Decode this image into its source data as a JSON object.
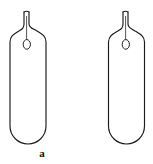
{
  "figure": {
    "title": "",
    "background_color": "#ffffff",
    "stroke_color": "#1a1a1a",
    "fill_color": "#ffffff",
    "width": 153,
    "height": 164,
    "panels": [
      {
        "id": "a",
        "caption": "a",
        "object": "sealed-capillary-tube",
        "description": "Sealed glass ampoule with rounded bottom, tapered shoulders and narrow capillary neck containing a small oval bubble",
        "geometry": {
          "body_left": 10,
          "body_right": 46,
          "body_bottom": 144,
          "bottom_radius": 18,
          "shoulder_top": 30,
          "neck_left": 24,
          "neck_right": 29,
          "neck_top": 12,
          "bubble_cx": 27,
          "bubble_cy": 44,
          "bubble_rx": 3.6,
          "bubble_ry": 4.8,
          "center_line_top": 16,
          "center_line_bottom": 40
        }
      },
      {
        "id": "b",
        "caption": "b",
        "object": "sealed-capillary-tube",
        "description": "Sealed glass ampoule with rounded bottom, tapered shoulders and narrow capillary neck containing a small oval bubble",
        "geometry": {
          "body_left": 32,
          "body_right": 69,
          "body_bottom": 144,
          "bottom_radius": 18,
          "shoulder_top": 30,
          "neck_left": 47,
          "neck_right": 52,
          "neck_top": 12,
          "bubble_cx": 50,
          "bubble_cy": 44,
          "bubble_rx": 3.6,
          "bubble_ry": 4.8,
          "center_line_top": 16,
          "center_line_bottom": 40
        }
      }
    ]
  }
}
